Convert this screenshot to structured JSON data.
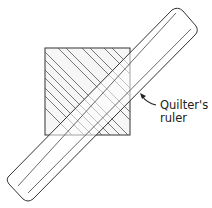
{
  "diagram": {
    "annotation": {
      "line1": "Quilter's",
      "line2": "ruler"
    },
    "elements": [
      "fabric-square",
      "diagonal-stripes",
      "quilters-ruler",
      "pointer-arrow"
    ],
    "colors": {
      "stroke": "#333333",
      "stripe": "#555555",
      "fill": "#f7f7f7"
    }
  }
}
